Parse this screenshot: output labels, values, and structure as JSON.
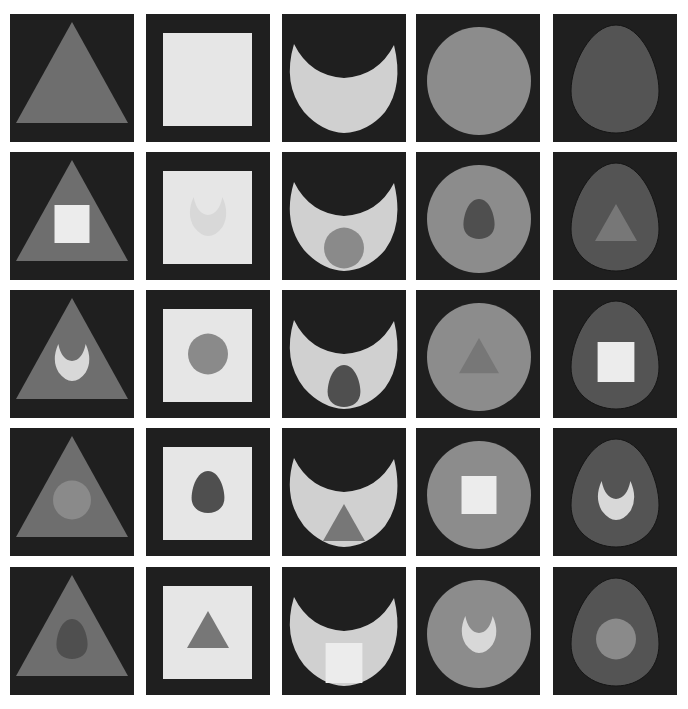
{
  "colors": {
    "background": "#ffffff",
    "tile": "#1f1f1f",
    "triangle": "#6e6e6e",
    "square": "#e6e6e6",
    "crescent": "#d0d0d0",
    "circle": "#8c8c8c",
    "egg": "#545454",
    "square_inner": "#ececec",
    "crescent_inner": "#d8d8d8",
    "circle_inner": "#8a8a8a",
    "egg_inner": "#4f4f4f",
    "triangle_inner": "#777777"
  },
  "grid": {
    "columns": [
      10,
      146,
      282,
      416,
      553
    ],
    "rows": [
      14,
      152,
      290,
      428,
      567
    ],
    "column_outer_shapes": [
      "triangle",
      "square",
      "crescent",
      "circle",
      "egg"
    ],
    "cells": [
      [
        "triangle",
        "square",
        "crescent",
        "circle",
        "egg"
      ],
      [
        "triangle+square",
        "square+crescent",
        "crescent+circle",
        "circle+egg",
        "egg+triangle"
      ],
      [
        "triangle+crescent",
        "square+circle",
        "crescent+egg",
        "circle+triangle",
        "egg+square"
      ],
      [
        "triangle+circle",
        "square+egg",
        "crescent+triangle",
        "circle+square",
        "egg+crescent"
      ],
      [
        "triangle+egg",
        "square+triangle",
        "crescent+square",
        "circle+crescent",
        "egg+circle"
      ]
    ]
  }
}
